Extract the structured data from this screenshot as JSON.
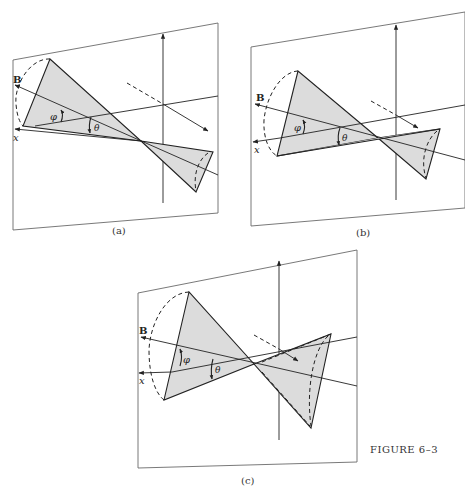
{
  "figure": {
    "caption": "Figure 6–3",
    "caption_small_caps": "FIGURE 6–3",
    "panels": [
      {
        "id": "a",
        "label": "(a)",
        "vector_label": "B",
        "axis_label": "x",
        "angles": [
          "φ",
          "θ"
        ]
      },
      {
        "id": "b",
        "label": "(b)",
        "vector_label": "B",
        "axis_label": "x",
        "angles": [
          "φ",
          "θ"
        ]
      },
      {
        "id": "c",
        "label": "(c)",
        "vector_label": "B",
        "axis_label": "x",
        "angles": [
          "φ",
          "θ"
        ]
      }
    ]
  },
  "colors": {
    "cone_fill": "#dcdcdc",
    "line": "#222222",
    "frame": "#6a6a6a",
    "background": "#ffffff"
  }
}
